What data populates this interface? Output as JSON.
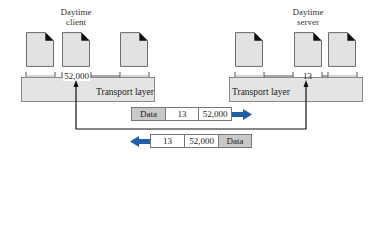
{
  "client": {
    "label_line1": "Daytime",
    "label_line2": "client",
    "port": "52,000",
    "layer_label": "Transport layer"
  },
  "server": {
    "label_line1": "Daytime",
    "label_line2": "server",
    "port": "13",
    "layer_label": "Transport layer"
  },
  "request_packet": {
    "cells": [
      "Data",
      "13",
      "52,000"
    ],
    "direction": "right"
  },
  "response_packet": {
    "cells": [
      "13",
      "52,000",
      "Data"
    ],
    "direction": "left"
  },
  "colors": {
    "doc_fill": "#e2e2e2",
    "layer_fill": "#e4e4e4",
    "data_cell_fill": "#c9c9c9",
    "arrow_blue": "#1f5fa8"
  }
}
